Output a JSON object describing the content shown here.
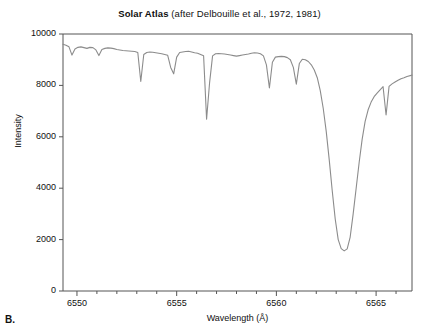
{
  "panel": {
    "letter": "B."
  },
  "chart_data": {
    "type": "line",
    "title_bold": "Solar Atlas",
    "title_rest": " (after Delbouille et al., 1972, 1981)",
    "title": "Solar Atlas (after Delbouille et al., 1972, 1981)",
    "xlabel": "Wavelength (Å)",
    "ylabel": "Intensity",
    "xlim": [
      6549.3,
      6566.8
    ],
    "ylim": [
      0,
      10000
    ],
    "grid": false,
    "legend": null,
    "xticks_major": [
      6550,
      6555,
      6560,
      6565
    ],
    "xticks_major_labels": [
      "6550",
      "6555",
      "6560",
      "6565"
    ],
    "xticks_minor": [
      6550,
      6551,
      6552,
      6553,
      6554,
      6555,
      6556,
      6557,
      6558,
      6559,
      6560,
      6561,
      6562,
      6563,
      6564,
      6565,
      6566
    ],
    "yticks": [
      0,
      2000,
      4000,
      6000,
      8000,
      10000
    ],
    "ytick_labels": [
      "0",
      "2000",
      "4000",
      "6000",
      "8000",
      "10000"
    ],
    "line_color": "#8c8c8c",
    "series_name": "Solar spectrum H-alpha region",
    "annotations": [],
    "x": [
      6549.3,
      6549.45,
      6549.6,
      6549.75,
      6549.9,
      6550.05,
      6550.2,
      6550.35,
      6550.5,
      6550.65,
      6550.8,
      6550.95,
      6551.1,
      6551.25,
      6551.4,
      6551.55,
      6551.7,
      6551.85,
      6552.0,
      6552.15,
      6552.3,
      6552.45,
      6552.6,
      6552.75,
      6552.9,
      6553.05,
      6553.2,
      6553.35,
      6553.5,
      6553.65,
      6553.8,
      6553.95,
      6554.1,
      6554.25,
      6554.4,
      6554.55,
      6554.7,
      6554.85,
      6555.0,
      6555.15,
      6555.3,
      6555.45,
      6555.6,
      6555.75,
      6555.9,
      6556.05,
      6556.2,
      6556.35,
      6556.5,
      6556.65,
      6556.8,
      6556.95,
      6557.1,
      6557.25,
      6557.4,
      6557.55,
      6557.7,
      6557.85,
      6558.0,
      6558.15,
      6558.3,
      6558.45,
      6558.6,
      6558.75,
      6558.9,
      6559.05,
      6559.2,
      6559.35,
      6559.5,
      6559.65,
      6559.8,
      6559.95,
      6560.1,
      6560.25,
      6560.4,
      6560.55,
      6560.7,
      6560.85,
      6561.0,
      6561.15,
      6561.3,
      6561.45,
      6561.6,
      6561.75,
      6561.9,
      6562.05,
      6562.2,
      6562.35,
      6562.5,
      6562.65,
      6562.8,
      6562.95,
      6563.1,
      6563.25,
      6563.4,
      6563.55,
      6563.7,
      6563.85,
      6564.0,
      6564.15,
      6564.3,
      6564.45,
      6564.6,
      6564.75,
      6564.9,
      6565.05,
      6565.2,
      6565.35,
      6565.5,
      6565.65,
      6565.8,
      6565.95,
      6566.1,
      6566.25,
      6566.4,
      6566.55,
      6566.8
    ],
    "y": [
      9600,
      9560,
      9500,
      9180,
      9420,
      9480,
      9500,
      9470,
      9440,
      9480,
      9470,
      9380,
      9160,
      9400,
      9440,
      9460,
      9450,
      9430,
      9400,
      9380,
      9360,
      9350,
      9340,
      9330,
      9320,
      9280,
      8150,
      9200,
      9280,
      9300,
      9290,
      9270,
      9250,
      9230,
      9200,
      9170,
      8700,
      8450,
      9100,
      9280,
      9300,
      9320,
      9330,
      9300,
      9270,
      9250,
      9200,
      9150,
      6680,
      8100,
      9150,
      9230,
      9240,
      9230,
      9220,
      9200,
      9180,
      9160,
      9140,
      9160,
      9180,
      9200,
      9220,
      9250,
      9270,
      9260,
      9230,
      9150,
      8800,
      7900,
      8900,
      9100,
      9120,
      9130,
      9120,
      9080,
      9000,
      8700,
      8050,
      8850,
      9020,
      9000,
      8930,
      8800,
      8600,
      8300,
      7800,
      7100,
      6200,
      5100,
      3900,
      2800,
      2000,
      1650,
      1560,
      1640,
      2100,
      3000,
      4000,
      5000,
      5900,
      6600,
      7050,
      7350,
      7560,
      7700,
      7830,
      7950,
      6850,
      7960,
      8060,
      8130,
      8200,
      8260,
      8300,
      8350,
      8400
    ]
  }
}
